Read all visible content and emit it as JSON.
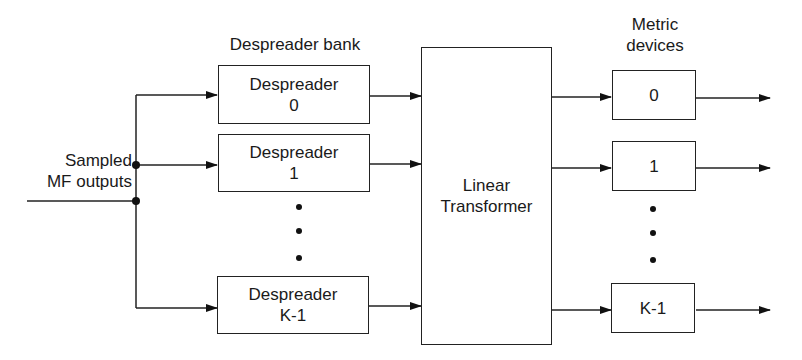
{
  "diagram": {
    "input_label": [
      "Sampled",
      "MF outputs"
    ],
    "despreader_bank": {
      "title": "Despreader bank",
      "boxes": [
        {
          "line1": "Despreader",
          "line2": "0"
        },
        {
          "line1": "Despreader",
          "line2": "1"
        },
        {
          "line1": "Despreader",
          "line2": "K-1"
        }
      ],
      "ellipsis": "⋮"
    },
    "transformer": {
      "line1": "Linear",
      "line2": "Transformer"
    },
    "metric_devices": {
      "title_line1": "Metric",
      "title_line2": "devices",
      "boxes": [
        {
          "label": "0"
        },
        {
          "label": "1"
        },
        {
          "label": "K-1"
        }
      ]
    },
    "colors": {
      "line": "#222222",
      "background": "#ffffff"
    }
  }
}
